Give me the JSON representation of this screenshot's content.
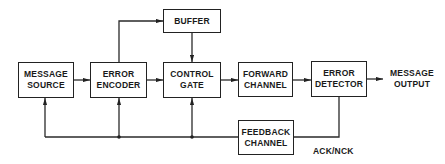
{
  "diagram": {
    "type": "block-diagram",
    "blocks": {
      "message_source": {
        "line1": "MESSAGE",
        "line2": "SOURCE"
      },
      "error_encoder": {
        "line1": "ERROR",
        "line2": "ENCODER"
      },
      "buffer": {
        "line1": "BUFFER"
      },
      "control_gate": {
        "line1": "CONTROL",
        "line2": "GATE"
      },
      "forward_channel": {
        "line1": "FORWARD",
        "line2": "CHANNEL"
      },
      "error_detector": {
        "line1": "ERROR",
        "line2": "DETECTOR"
      },
      "feedback_channel": {
        "line1": "FEEDBACK",
        "line2": "CHANNEL"
      }
    },
    "labels": {
      "message_output": {
        "line1": "MESSAGE",
        "line2": "OUTPUT"
      },
      "ack_nck": "ACK/NCK"
    },
    "connections": [
      {
        "from": "MESSAGE SOURCE",
        "to": "ERROR ENCODER"
      },
      {
        "from": "ERROR ENCODER",
        "to": "CONTROL GATE"
      },
      {
        "from": "ERROR ENCODER",
        "to": "BUFFER"
      },
      {
        "from": "BUFFER",
        "to": "CONTROL GATE"
      },
      {
        "from": "CONTROL GATE",
        "to": "FORWARD CHANNEL"
      },
      {
        "from": "FORWARD CHANNEL",
        "to": "ERROR DETECTOR"
      },
      {
        "from": "ERROR DETECTOR",
        "to": "MESSAGE OUTPUT"
      },
      {
        "from": "ERROR DETECTOR",
        "to": "FEEDBACK CHANNEL",
        "label": "ACK/NCK"
      },
      {
        "from": "FEEDBACK CHANNEL",
        "to": "CONTROL GATE"
      },
      {
        "from": "FEEDBACK CHANNEL",
        "to": "ERROR ENCODER"
      },
      {
        "from": "FEEDBACK CHANNEL",
        "to": "MESSAGE SOURCE"
      }
    ],
    "line_color": "#2a2a2a"
  }
}
